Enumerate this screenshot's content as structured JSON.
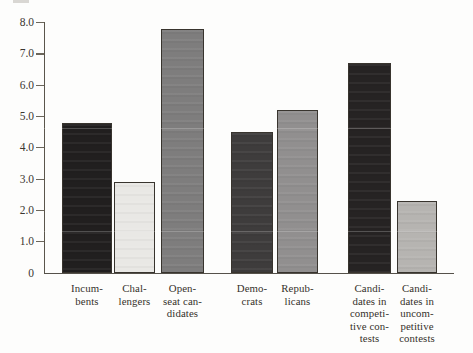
{
  "chart_data": {
    "type": "bar",
    "title": "",
    "xlabel": "",
    "ylabel": "",
    "ylim": [
      0,
      8
    ],
    "grid": false,
    "legend": null,
    "yticks": [
      {
        "label": "8.0",
        "value": 8
      },
      {
        "label": "7.0",
        "value": 7
      },
      {
        "label": "6.0",
        "value": 6
      },
      {
        "label": "5.0",
        "value": 5
      },
      {
        "label": "4.0",
        "value": 4
      },
      {
        "label": "3.0",
        "value": 3
      },
      {
        "label": "2.0",
        "value": 2
      },
      {
        "label": "1.0",
        "value": 1
      },
      {
        "label": "0",
        "value": 0
      }
    ],
    "categories": [
      "Incumbents",
      "Challengers",
      "Open-seat candidates",
      "Democrats",
      "Republicans",
      "Candidates in competitive contests",
      "Candidates in uncompetitive contests"
    ],
    "category_label_lines": [
      [
        "Incum-",
        "bents"
      ],
      [
        "Chal-",
        "lengers"
      ],
      [
        "Open-",
        "seat can-",
        "didates"
      ],
      [
        "Demo-",
        "crats"
      ],
      [
        "Repub-",
        "licans"
      ],
      [
        "Candi-",
        "dates in",
        "competi-",
        "tive con-",
        "tests"
      ],
      [
        "Candi-",
        "dates in",
        "uncom-",
        "petitive",
        "contests"
      ]
    ],
    "values": [
      4.8,
      2.9,
      7.8,
      4.5,
      5.2,
      6.7,
      2.3
    ],
    "bar_colors": [
      "#211f1f",
      "#e9e8e5",
      "#7e7d7d",
      "#3e3c3c",
      "#918f8f",
      "#262323",
      "#b6b4b1"
    ]
  },
  "colors": {
    "axis": "#5a554b",
    "tick": "#6b665b",
    "text": "#3b3631",
    "paper": "#fdfdfc"
  }
}
